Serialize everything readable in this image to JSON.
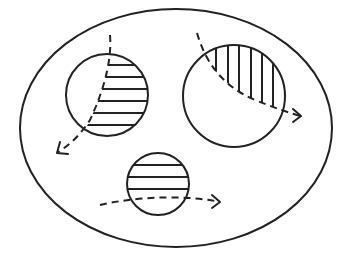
{
  "diagram": {
    "type": "set-diagram",
    "colors": {
      "stroke": "#222222",
      "background": "#ffffff"
    },
    "outer_ellipse": {
      "cx": 176,
      "cy": 128,
      "rx": 156,
      "ry": 119
    },
    "circles": [
      {
        "id": "left",
        "cx": 107,
        "cy": 95,
        "r": 41,
        "hatch": "horizontal",
        "hatched_side": "right of dashed curve",
        "hatch_lines_y": [
          65,
          77,
          89,
          101,
          113,
          125
        ]
      },
      {
        "id": "right",
        "cx": 234,
        "cy": 96,
        "r": 51,
        "hatch": "vertical",
        "hatched_side": "upper-right of dashed curve",
        "hatch_lines_x": [
          216,
          228,
          239,
          251,
          262,
          273
        ]
      },
      {
        "id": "bottom",
        "cx": 158,
        "cy": 184,
        "r": 31,
        "hatch": "horizontal",
        "hatched_side": "above dashed curve",
        "hatch_lines_y": [
          165,
          177,
          189
        ]
      }
    ],
    "arrows": [
      {
        "id": "left-arrow",
        "start": [
          110,
          35
        ],
        "end": [
          57,
          153
        ],
        "style": "dashed",
        "direction": "down-left"
      },
      {
        "id": "right-arrow",
        "start": [
          197,
          33
        ],
        "end": [
          301,
          116
        ],
        "style": "dashed",
        "direction": "down-right"
      },
      {
        "id": "bottom-arrow",
        "start": [
          100,
          205
        ],
        "end": [
          220,
          202
        ],
        "style": "dashed",
        "direction": "right"
      }
    ]
  }
}
